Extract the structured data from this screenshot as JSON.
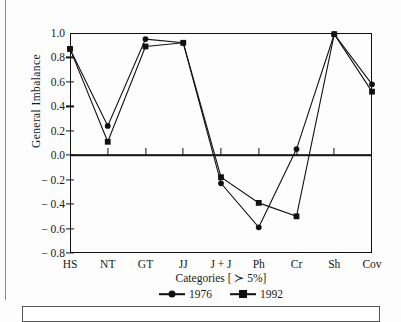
{
  "figure": {
    "ylabel": "General Imbalance",
    "xlabel": "Categories [ ≻ 5%]"
  },
  "legend": {
    "entries": [
      {
        "label": "1976",
        "marker": "circle-marker"
      },
      {
        "label": "1992",
        "marker": "square-marker"
      }
    ]
  },
  "chart_data": {
    "type": "line",
    "title": "",
    "xlabel": "Categories [ ≻ 5%]",
    "ylabel": "General Imbalance",
    "categories": [
      "HS",
      "NT",
      "GT",
      "JJ",
      "J + J",
      "Ph",
      "Cr",
      "Sh",
      "Cov"
    ],
    "ylim": [
      -0.8,
      1.0
    ],
    "yticks": [
      "1.0",
      "0.8",
      "0.6",
      "0.4",
      "0.2",
      "0.0",
      "− 0.2",
      "− 0.4",
      "− 0.6",
      "− 0.8"
    ],
    "ytick_values": [
      1.0,
      0.8,
      0.6,
      0.4,
      0.2,
      0.0,
      -0.2,
      -0.4,
      -0.6,
      -0.8
    ],
    "grid": false,
    "legend_position": "bottom",
    "zero_baseline": 0.0,
    "series": [
      {
        "name": "1976",
        "marker": "circle",
        "values": [
          0.87,
          0.24,
          0.95,
          0.92,
          -0.23,
          -0.59,
          0.05,
          0.99,
          0.58
        ]
      },
      {
        "name": "1992",
        "marker": "square",
        "values": [
          0.87,
          0.11,
          0.89,
          0.92,
          -0.18,
          -0.39,
          -0.5,
          0.99,
          0.52
        ]
      }
    ]
  }
}
